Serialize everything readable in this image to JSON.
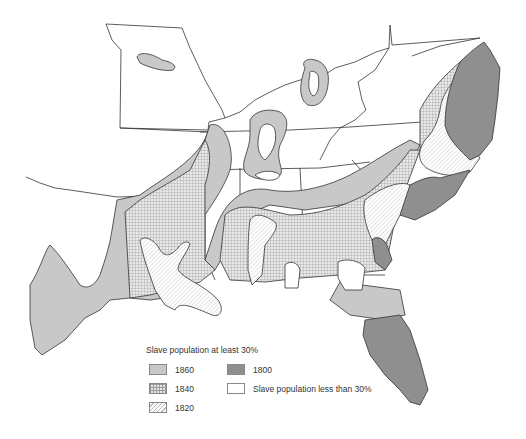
{
  "legend": {
    "title": "Slave population at least 30%",
    "items": [
      {
        "label": "1860",
        "pattern": "light-gray-solid",
        "color": "#c8c8c8"
      },
      {
        "label": "1800",
        "pattern": "dark-gray-solid",
        "color": "#8f8f8f"
      },
      {
        "label": "1840",
        "pattern": "crosshatch-grid",
        "color": "#e6e6e6"
      },
      {
        "label": "Slave population less than 30%",
        "pattern": "white",
        "color": "#ffffff"
      },
      {
        "label": "1820",
        "pattern": "diagonal-hatch",
        "color": "#b8b8b8"
      }
    ]
  },
  "map": {
    "region": "Southern United States",
    "colors": {
      "outline": "#333333",
      "fill_1860": "#c8c8c8",
      "fill_1800": "#8f8f8f",
      "fill_1840_base": "#e6e6e6",
      "fill_1820_base": "#ffffff",
      "background": "#ffffff"
    }
  }
}
